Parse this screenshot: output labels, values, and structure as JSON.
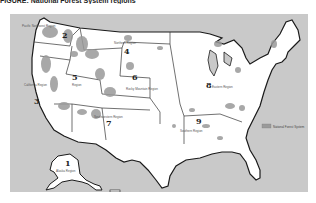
{
  "title": "FIGURE: National Forest System regions",
  "map": {
    "type": "regional-map",
    "subject": "United States Forest Service regions",
    "colors": {
      "ocean": "#c9c9c9",
      "land": "#ffffff",
      "forest": "#9a9a9a",
      "border": "#1a1a1a"
    },
    "regions": [
      {
        "number": "1",
        "name": "Northern Region"
      },
      {
        "number": "2",
        "name": "Rocky Mountain Region"
      },
      {
        "number": "3",
        "name": "Southwestern Region"
      },
      {
        "number": "4",
        "name": "Intermountain Region"
      },
      {
        "number": "5",
        "name": "Pacific Southwest Region"
      },
      {
        "number": "6",
        "name": "Pacific Northwest Region"
      },
      {
        "number": "8",
        "name": "Southern Region"
      },
      {
        "number": "9",
        "name": "Eastern Region"
      },
      {
        "number": "10",
        "name": "Alaska Region"
      }
    ],
    "map_labels": [
      {
        "id": "r2-pnw",
        "number": "2",
        "label": "Pacific Northwest Region"
      },
      {
        "id": "r3-ca",
        "number": "3",
        "label": "California Region"
      },
      {
        "id": "r4",
        "number": "4",
        "label": "Northern Region"
      },
      {
        "id": "r5",
        "number": "5",
        "label": "Region"
      },
      {
        "id": "r6",
        "number": "6",
        "label": "Rocky Mountain Region"
      },
      {
        "id": "r7",
        "number": "7",
        "label": "Southwestern Region"
      },
      {
        "id": "r8",
        "number": "8",
        "label": "Eastern Region"
      },
      {
        "id": "r9",
        "number": "9",
        "label": "Southern Region"
      },
      {
        "id": "r1-ak",
        "number": "1",
        "label": "Alaska Region"
      }
    ],
    "legend": {
      "label": "National Forest System"
    }
  }
}
